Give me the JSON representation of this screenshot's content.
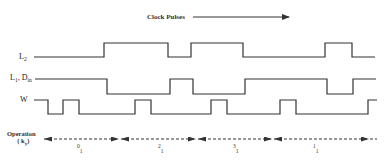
{
  "header": {
    "title": "Clock Pulses"
  },
  "signals": [
    {
      "id": "L2",
      "label_main": "L",
      "label_sub": "2",
      "high_y": 43,
      "low_y": 57,
      "points": [
        [
          34,
          57
        ],
        [
          104,
          57
        ],
        [
          104,
          43
        ],
        [
          168,
          43
        ],
        [
          168,
          57
        ],
        [
          191,
          57
        ],
        [
          191,
          43
        ],
        [
          243,
          43
        ],
        [
          243,
          57
        ],
        [
          325,
          57
        ],
        [
          325,
          43
        ],
        [
          352,
          43
        ],
        [
          352,
          57
        ],
        [
          375,
          57
        ]
      ]
    },
    {
      "id": "L1_Din",
      "label_main": "L",
      "label_sub": "1",
      "label_sep": ", ",
      "label_main2": "D",
      "label_sub2": "in",
      "high_y": 79,
      "low_y": 94,
      "points": [
        [
          35,
          79
        ],
        [
          107,
          79
        ],
        [
          107,
          94
        ],
        [
          170,
          94
        ],
        [
          170,
          79
        ],
        [
          193,
          79
        ],
        [
          193,
          94
        ],
        [
          245,
          94
        ],
        [
          245,
          79
        ],
        [
          327,
          79
        ],
        [
          327,
          94
        ],
        [
          353,
          94
        ],
        [
          353,
          79
        ],
        [
          376,
          79
        ]
      ]
    },
    {
      "id": "W",
      "label_main": "W",
      "high_y": 100,
      "low_y": 114,
      "points": [
        [
          34,
          100
        ],
        [
          48,
          100
        ],
        [
          48,
          114
        ],
        [
          63,
          114
        ],
        [
          63,
          100
        ],
        [
          79,
          100
        ],
        [
          79,
          114
        ],
        [
          135,
          114
        ],
        [
          135,
          100
        ],
        [
          151,
          100
        ],
        [
          151,
          114
        ],
        [
          211,
          114
        ],
        [
          211,
          100
        ],
        [
          227,
          100
        ],
        [
          227,
          114
        ],
        [
          280,
          114
        ],
        [
          280,
          100
        ],
        [
          296,
          100
        ],
        [
          296,
          114
        ],
        [
          368,
          114
        ],
        [
          368,
          100
        ],
        [
          377,
          100
        ]
      ]
    }
  ],
  "operation": {
    "label_line1": "Operation",
    "label_line2_open": "( k",
    "label_line2_sub": "y",
    "label_line2_close": ")",
    "arrow_y": 139,
    "boundaries": [
      43,
      120,
      197,
      273,
      370
    ],
    "segments": [
      {
        "sup": "0",
        "sub": "1",
        "x": 77
      },
      {
        "sup": "2",
        "sub": "1",
        "x": 158
      },
      {
        "sup": "3",
        "sub": "1",
        "x": 233
      },
      {
        "sup": "1",
        "sub": "1",
        "x": 313
      }
    ]
  },
  "colors": {
    "line": "#333333",
    "text": "#222222",
    "background": "#ffffff"
  }
}
